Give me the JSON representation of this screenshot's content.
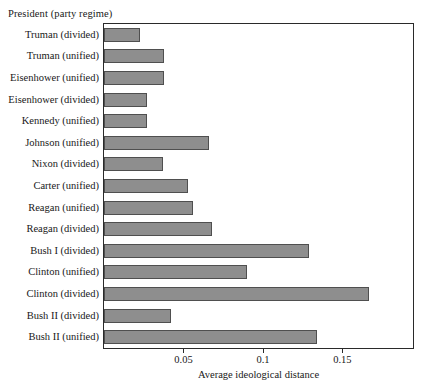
{
  "chart_data": {
    "type": "bar",
    "orientation": "horizontal",
    "title": "",
    "legend_title": "President (party regime)",
    "xlabel": "Average ideological distance",
    "ylabel": "President (party regime)",
    "xlim": [
      0,
      0.1944
    ],
    "xticks": [
      0.05,
      0.1,
      0.15
    ],
    "xtick_labels": [
      "0.05",
      "0.1",
      "0.15"
    ],
    "grid": false,
    "legend_position": "none",
    "bar_color": "#8e8e8e",
    "bar_edge_color": "#4f4f4f",
    "categories": [
      "Truman (divided)",
      "Truman (unified)",
      "Eisenhower (unified)",
      "Eisenhower (divided)",
      "Kennedy (unified)",
      "Johnson (unified)",
      "Nixon (divided)",
      "Carter (unified)",
      "Reagan (unified)",
      "Reagan (divided)",
      "Bush I (divided)",
      "Clinton (unified)",
      "Clinton (divided)",
      "Bush II (divided)",
      "Bush II (unified)"
    ],
    "values": [
      0.0225,
      0.038,
      0.038,
      0.027,
      0.027,
      0.066,
      0.037,
      0.053,
      0.056,
      0.068,
      0.129,
      0.09,
      0.167,
      0.042,
      0.134
    ]
  }
}
